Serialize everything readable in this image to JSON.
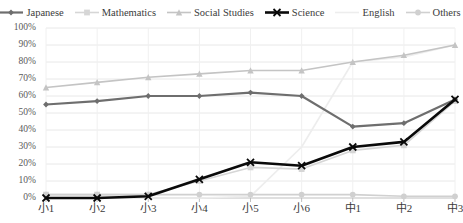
{
  "chart_data": {
    "type": "line",
    "title": "",
    "xlabel": "",
    "ylabel": "",
    "ylim": [
      0,
      100
    ],
    "ytick_labels": [
      "100%",
      "90%",
      "80%",
      "70%",
      "60%",
      "50%",
      "40%",
      "30%",
      "20%",
      "10%",
      "0%"
    ],
    "ytick_values": [
      100,
      90,
      80,
      70,
      60,
      50,
      40,
      30,
      20,
      10,
      0
    ],
    "grid": "horizontal-and-vertical-light",
    "legend_position": "top",
    "categories": [
      "小1",
      "小2",
      "小3",
      "小4",
      "小5",
      "小6",
      "中1",
      "中2",
      "中3"
    ],
    "series": [
      {
        "name": "Japanese",
        "color": "#6e6e6e",
        "marker": "diamond",
        "width": 2.2,
        "values": [
          55,
          57,
          60,
          60,
          62,
          60,
          42,
          44,
          58
        ]
      },
      {
        "name": "Mathematics",
        "color": "#d6d6d6",
        "marker": "square",
        "width": 1.6,
        "values": [
          2,
          2,
          2,
          10,
          18,
          17,
          28,
          31,
          57
        ]
      },
      {
        "name": "Social Studies",
        "color": "#c4c4c4",
        "marker": "triangle",
        "width": 1.6,
        "values": [
          65,
          68,
          71,
          73,
          75,
          75,
          80,
          84,
          90
        ]
      },
      {
        "name": "Science",
        "color": "#0a0a0a",
        "marker": "x",
        "width": 2.6,
        "values": [
          0,
          0,
          1,
          11,
          21,
          19,
          30,
          33,
          58
        ]
      },
      {
        "name": "English",
        "color": "#ededed",
        "marker": "none",
        "width": 1.6,
        "values": [
          0,
          0,
          0,
          0,
          1,
          30,
          80,
          83,
          90
        ]
      },
      {
        "name": "Others",
        "color": "#d0d0d0",
        "marker": "circle",
        "width": 1.6,
        "values": [
          2,
          2,
          2,
          2,
          2,
          2,
          2,
          1,
          1
        ]
      }
    ]
  },
  "axis": {
    "grid_color": "#e8e8e8",
    "axis_color": "#bfbfbf"
  }
}
